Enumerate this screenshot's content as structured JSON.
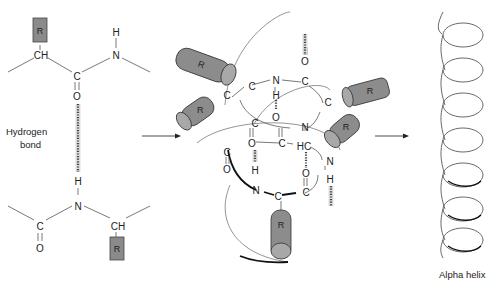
{
  "figure": {
    "left_panel": {
      "top_residue": {
        "r_group": "R",
        "alpha_carbon": "CH",
        "carbonyl_c": "C",
        "carbonyl_o": "O",
        "amide_n": "N",
        "amide_h": "H"
      },
      "bottom_residue": {
        "r_group": "R",
        "alpha_carbon": "CH",
        "carbonyl_c": "C",
        "carbonyl_o": "O",
        "amide_n": "N",
        "amide_h": "H"
      },
      "label_line1": "Hydrogen",
      "label_line2": "bond"
    },
    "middle_panel": {
      "r_groups": [
        "R",
        "R",
        "R",
        "R",
        "R"
      ],
      "atoms": {
        "n1": "N",
        "h1": "H",
        "o1": "O",
        "c_top": "C",
        "o_top": "O",
        "c_a": "C",
        "c_b": "C",
        "c_right": "C",
        "n2": "N",
        "c_mid1": "C",
        "o_mid1": "O",
        "c_mid2": "C",
        "hc": "HC",
        "c_left": "C",
        "o_left": "O",
        "o2": "O",
        "h2": "H",
        "n3": "N",
        "c_bot": "C",
        "c_bot2": "C",
        "o3": "O",
        "n4": "N",
        "h4": "H"
      }
    },
    "right_panel": {
      "label": "Alpha helix",
      "turns": 7
    },
    "arrows": [
      "arrow-left-to-middle",
      "arrow-middle-to-right"
    ]
  }
}
